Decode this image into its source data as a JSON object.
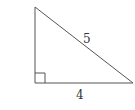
{
  "diagram": {
    "type": "right-triangle",
    "stroke_color": "#555555",
    "labels": {
      "hypotenuse": "5",
      "base": "4"
    },
    "right_angle_marker": true
  }
}
